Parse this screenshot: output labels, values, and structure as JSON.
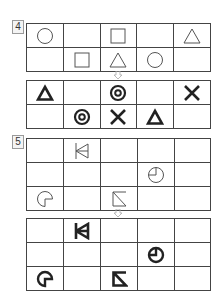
{
  "problems": [
    {
      "number": "4",
      "before": {
        "rows": [
          [
            "circle",
            "",
            "square",
            "",
            "triangle"
          ],
          [
            "",
            "square",
            "triangle",
            "circle",
            ""
          ]
        ]
      },
      "arrow": "down-arrow",
      "after": {
        "rows": [
          [
            "bold-triangle",
            "",
            "bullseye",
            "",
            "bold-x"
          ],
          [
            "",
            "bullseye",
            "bold-x",
            "bold-triangle",
            ""
          ]
        ]
      }
    },
    {
      "number": "5",
      "before": {
        "rows": [
          [
            "",
            "fan-triangle",
            "",
            "",
            ""
          ],
          [
            "",
            "",
            "",
            "clock-circle",
            ""
          ],
          [
            "cutout-circle",
            "",
            "slash-box",
            "",
            ""
          ]
        ]
      },
      "arrow": "down-arrow",
      "after": {
        "rows": [
          [
            "",
            "bold-fan-triangle",
            "",
            "",
            ""
          ],
          [
            "",
            "",
            "",
            "bold-clock-circle",
            ""
          ],
          [
            "bold-cutout-circle",
            "",
            "bold-slash-box",
            "",
            ""
          ]
        ]
      }
    }
  ],
  "colors": {
    "line": "#444444",
    "thin_symbol": "#555555",
    "bold_symbol": "#222222"
  }
}
